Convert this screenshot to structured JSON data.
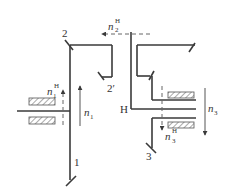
{
  "diagram": {
    "type": "planetary gear train schematic",
    "colors": {
      "line": "#3a3a3a",
      "hatch": "#555555",
      "background": "#ffffff"
    },
    "labels": {
      "gear1": "1",
      "gear2": "2",
      "gear2p": "2′",
      "gear3": "3",
      "carrier": "H",
      "n1": "n",
      "n1_sub": "1",
      "n1H": "n",
      "n1H_sup": "H",
      "n1H_sub": "1",
      "n2H": "n",
      "n2H_sup": "H",
      "n2H_sub": "2",
      "n3": "n",
      "n3_sub": "3",
      "n3H": "n",
      "n3H_sup": "H",
      "n3H_sub": "3"
    },
    "arrows": [
      {
        "name": "n1",
        "direction": "up",
        "style": "solid"
      },
      {
        "name": "n1H",
        "direction": "up",
        "style": "dashed"
      },
      {
        "name": "n2H",
        "direction": "left",
        "style": "dashed"
      },
      {
        "name": "n3",
        "direction": "down",
        "style": "solid"
      },
      {
        "name": "n3H",
        "direction": "down",
        "style": "dashed"
      }
    ]
  }
}
